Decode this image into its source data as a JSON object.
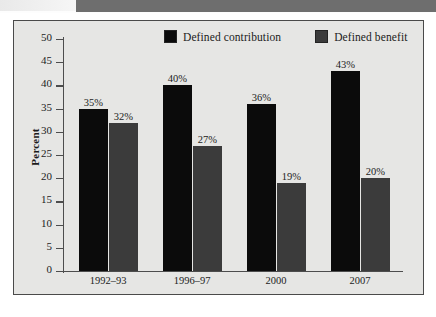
{
  "chart_data": {
    "type": "bar",
    "title": "",
    "xlabel": "",
    "ylabel": "Percent",
    "ylim": [
      0,
      50
    ],
    "ytick_step": 5,
    "yticks": [
      50,
      45,
      40,
      35,
      30,
      25,
      20,
      15,
      10,
      5,
      0
    ],
    "categories": [
      "1992–93",
      "1996–97",
      "2000",
      "2007"
    ],
    "grid": false,
    "legend_position": "top",
    "series": [
      {
        "name": "Defined contribution",
        "color": "#0b0b0b",
        "values": [
          35,
          40,
          36,
          43
        ],
        "data_labels": [
          "35%",
          "40%",
          "36%",
          "43%"
        ]
      },
      {
        "name": "Defined benefit",
        "color": "#3b3b3b",
        "values": [
          32,
          27,
          19,
          20
        ],
        "data_labels": [
          "32%",
          "27%",
          "19%",
          "20%"
        ]
      }
    ]
  },
  "legend": {
    "items": [
      {
        "label": "Defined contribution",
        "color": "#0b0b0b"
      },
      {
        "label": "Defined benefit",
        "color": "#3b3b3b"
      }
    ]
  },
  "axis": {
    "y_title": "Percent"
  },
  "colors": {
    "frame_border": "#4a4a4a",
    "plot_background": "#e6e6e4",
    "banner": "#6e6e6e",
    "series_primary": "#0b0b0b",
    "series_secondary": "#3b3b3b"
  }
}
